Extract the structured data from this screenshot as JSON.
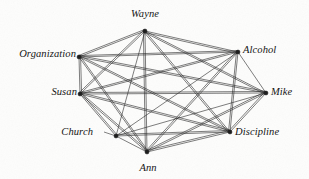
{
  "figure": {
    "type": "network-graph",
    "background_color": "#fdfdfc",
    "edge_color": "#2b2b2b",
    "node_color": "#1a1a1a",
    "width": 309,
    "height": 179
  },
  "graph_data": {
    "type": "graph",
    "directed": false,
    "node_count": 8,
    "edge_count": 27,
    "nodes": [
      {
        "id": "wayne",
        "label": "Wayne",
        "x": 145,
        "y": 31,
        "label_x": 145,
        "label_y": 14,
        "label_anchor": "center",
        "leader": false
      },
      {
        "id": "alcohol",
        "label": "Alcohol",
        "x": 238,
        "y": 52,
        "label_x": 243,
        "label_y": 50,
        "label_anchor": "right",
        "leader": false
      },
      {
        "id": "mike",
        "label": "Mike",
        "x": 266,
        "y": 93,
        "label_x": 271,
        "label_y": 92,
        "label_anchor": "right",
        "leader": false
      },
      {
        "id": "discipline",
        "label": "Discipline",
        "x": 230,
        "y": 132,
        "label_x": 235,
        "label_y": 132,
        "label_anchor": "right",
        "leader": false
      },
      {
        "id": "ann",
        "label": "Ann",
        "x": 147,
        "y": 152,
        "label_x": 148,
        "label_y": 168,
        "label_anchor": "center",
        "leader": false
      },
      {
        "id": "church",
        "label": "Church",
        "x": 116,
        "y": 136,
        "label_x": 93,
        "label_y": 132,
        "label_anchor": "left",
        "leader": true
      },
      {
        "id": "susan",
        "label": "Susan",
        "x": 80,
        "y": 94,
        "label_x": 77,
        "label_y": 92,
        "label_anchor": "left",
        "leader": false
      },
      {
        "id": "organization",
        "label": "Organization",
        "x": 79,
        "y": 57,
        "label_x": 76,
        "label_y": 54,
        "label_anchor": "left",
        "leader": false
      }
    ],
    "edges": [
      {
        "source": "wayne",
        "target": "alcohol"
      },
      {
        "source": "wayne",
        "target": "mike"
      },
      {
        "source": "wayne",
        "target": "discipline"
      },
      {
        "source": "wayne",
        "target": "ann"
      },
      {
        "source": "wayne",
        "target": "church"
      },
      {
        "source": "wayne",
        "target": "susan"
      },
      {
        "source": "wayne",
        "target": "organization"
      },
      {
        "source": "alcohol",
        "target": "mike"
      },
      {
        "source": "alcohol",
        "target": "discipline"
      },
      {
        "source": "alcohol",
        "target": "ann"
      },
      {
        "source": "alcohol",
        "target": "church"
      },
      {
        "source": "alcohol",
        "target": "susan"
      },
      {
        "source": "alcohol",
        "target": "organization"
      },
      {
        "source": "mike",
        "target": "discipline"
      },
      {
        "source": "mike",
        "target": "ann"
      },
      {
        "source": "mike",
        "target": "church"
      },
      {
        "source": "mike",
        "target": "susan"
      },
      {
        "source": "mike",
        "target": "organization"
      },
      {
        "source": "discipline",
        "target": "ann"
      },
      {
        "source": "discipline",
        "target": "church"
      },
      {
        "source": "discipline",
        "target": "susan"
      },
      {
        "source": "discipline",
        "target": "organization"
      },
      {
        "source": "ann",
        "target": "church"
      },
      {
        "source": "ann",
        "target": "susan"
      },
      {
        "source": "ann",
        "target": "organization"
      },
      {
        "source": "church",
        "target": "susan"
      },
      {
        "source": "susan",
        "target": "organization"
      }
    ],
    "double_edges": [
      {
        "source": "wayne",
        "target": "ann",
        "offset": 1.6
      },
      {
        "source": "wayne",
        "target": "discipline",
        "offset": 1.5
      },
      {
        "source": "wayne",
        "target": "organization",
        "offset": 1.5
      },
      {
        "source": "wayne",
        "target": "susan",
        "offset": 1.5
      },
      {
        "source": "wayne",
        "target": "alcohol",
        "offset": 1.5
      },
      {
        "source": "wayne",
        "target": "mike",
        "offset": 1.4
      },
      {
        "source": "alcohol",
        "target": "ann",
        "offset": 1.5
      },
      {
        "source": "alcohol",
        "target": "susan",
        "offset": 1.4
      },
      {
        "source": "alcohol",
        "target": "organization",
        "offset": 1.4
      },
      {
        "source": "alcohol",
        "target": "discipline",
        "offset": 1.5
      },
      {
        "source": "mike",
        "target": "susan",
        "offset": 1.5
      },
      {
        "source": "mike",
        "target": "organization",
        "offset": 1.5
      },
      {
        "source": "mike",
        "target": "ann",
        "offset": 1.5
      },
      {
        "source": "mike",
        "target": "discipline",
        "offset": 1.6
      },
      {
        "source": "discipline",
        "target": "susan",
        "offset": 1.5
      },
      {
        "source": "discipline",
        "target": "organization",
        "offset": 1.4
      },
      {
        "source": "discipline",
        "target": "ann",
        "offset": 1.6
      },
      {
        "source": "discipline",
        "target": "church",
        "offset": 1.5
      },
      {
        "source": "ann",
        "target": "susan",
        "offset": 1.5
      },
      {
        "source": "ann",
        "target": "organization",
        "offset": 1.4
      },
      {
        "source": "susan",
        "target": "organization",
        "offset": 1.6
      },
      {
        "source": "church",
        "target": "susan",
        "offset": 1.5
      }
    ],
    "node_radius": 2.0,
    "leader_lines": [
      {
        "from_x": 104,
        "from_y": 132,
        "to_x": 116,
        "to_y": 136
      }
    ]
  }
}
